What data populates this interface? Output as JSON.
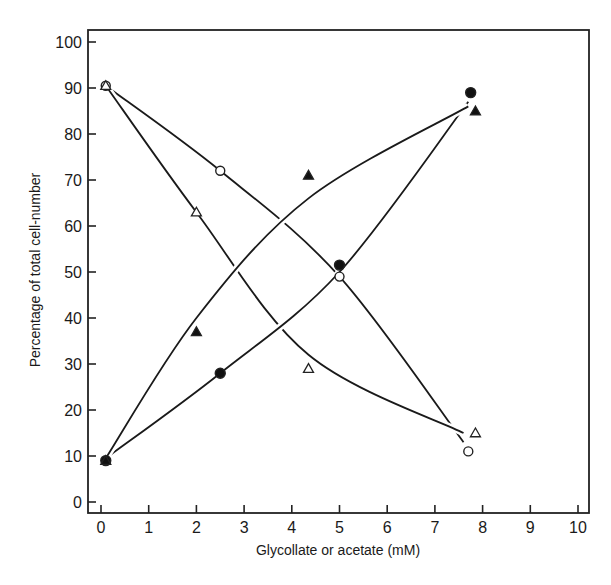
{
  "chart_data": {
    "type": "line",
    "title": "",
    "xlabel": "Glycollate or acetate (mM)",
    "ylabel": "Percentage of total cell-number",
    "xlim": [
      0,
      10
    ],
    "ylim": [
      0,
      100
    ],
    "x_ticks": [
      0,
      1,
      2,
      3,
      4,
      5,
      6,
      7,
      8,
      9,
      10
    ],
    "y_ticks": [
      0,
      10,
      20,
      30,
      40,
      50,
      60,
      70,
      80,
      90,
      100
    ],
    "grid": false,
    "legend": null,
    "series": [
      {
        "name": "open-circle",
        "marker": "open-circle",
        "points": [
          [
            0.1,
            90.5
          ],
          [
            2.5,
            72
          ],
          [
            5.0,
            49
          ],
          [
            7.7,
            11
          ]
        ],
        "curve": [
          [
            0.1,
            90.5
          ],
          [
            2.5,
            72
          ],
          [
            5.0,
            49
          ],
          [
            7.6,
            13
          ]
        ]
      },
      {
        "name": "open-triangle",
        "marker": "open-triangle",
        "points": [
          [
            0.1,
            90.5
          ],
          [
            2.0,
            63
          ],
          [
            4.35,
            29
          ],
          [
            7.85,
            15
          ]
        ],
        "curve": [
          [
            0.1,
            90.5
          ],
          [
            2.0,
            63
          ],
          [
            4.35,
            32
          ],
          [
            7.6,
            15
          ]
        ]
      },
      {
        "name": "filled-circle",
        "marker": "filled-circle",
        "points": [
          [
            0.1,
            9
          ],
          [
            2.5,
            28
          ],
          [
            5.0,
            51.5
          ],
          [
            7.75,
            89
          ]
        ],
        "curve": [
          [
            0.1,
            9.5
          ],
          [
            2.5,
            28
          ],
          [
            5.0,
            50
          ],
          [
            7.7,
            87
          ]
        ]
      },
      {
        "name": "filled-triangle",
        "marker": "filled-triangle",
        "points": [
          [
            0.1,
            9
          ],
          [
            2.0,
            37
          ],
          [
            4.35,
            71
          ],
          [
            7.85,
            85
          ]
        ],
        "curve": [
          [
            0.1,
            9.5
          ],
          [
            2.0,
            40
          ],
          [
            4.35,
            66
          ],
          [
            7.7,
            86
          ]
        ]
      }
    ]
  },
  "axes": {
    "xlabel": "Glycollate or acetate (mM)",
    "ylabel": "Percentage of total cell-number",
    "x_tick_labels": [
      "0",
      "1",
      "2",
      "3",
      "4",
      "5",
      "6",
      "7",
      "8",
      "9",
      "10"
    ],
    "y_tick_labels": [
      "0",
      "10",
      "20",
      "30",
      "40",
      "50",
      "60",
      "70",
      "80",
      "90",
      "100"
    ]
  }
}
